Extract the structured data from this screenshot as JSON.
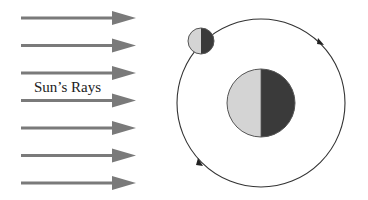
{
  "diagram": {
    "rays": {
      "label": "Sun’s Rays",
      "count": 7,
      "color": "#7a7a7a",
      "direction": "left-to-right"
    },
    "earth": {
      "lit_color": "#d4d4d4",
      "dark_color": "#3a3a3a",
      "outline_color": "#555555"
    },
    "moon": {
      "lit_color": "#d4d4d4",
      "dark_color": "#3a3a3a",
      "outline_color": "#555555"
    },
    "orbit": {
      "color": "#333333",
      "direction": "counterclockwise"
    }
  }
}
